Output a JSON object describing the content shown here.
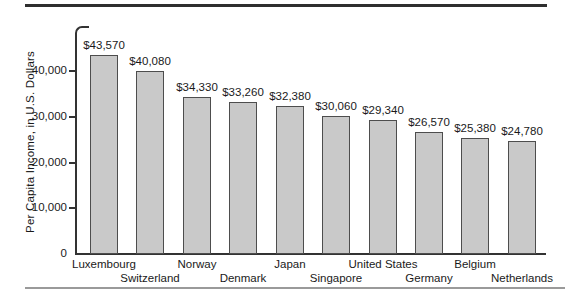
{
  "chart_data": {
    "type": "bar",
    "title": "",
    "categories": [
      "Luxembourg",
      "Switzerland",
      "Norway",
      "Denmark",
      "Japan",
      "Singapore",
      "United States",
      "Germany",
      "Belgium",
      "Netherlands"
    ],
    "values": [
      43570,
      40080,
      34330,
      33260,
      32380,
      30060,
      29340,
      26570,
      25380,
      24780
    ],
    "value_labels": [
      "$43,570",
      "$40,080",
      "$34,330",
      "$33,260",
      "$32,380",
      "$30,060",
      "$29,340",
      "$26,570",
      "$25,380",
      "$24,780"
    ],
    "xlabel": "",
    "ylabel": "Per Capita Income, in U.S. Dollars",
    "ylim": [
      0,
      46000
    ],
    "yticks": [
      0,
      10000,
      20000,
      30000,
      40000
    ],
    "ytick_labels": [
      "0",
      "10,000",
      "20,000",
      "30,000",
      "40,000"
    ],
    "grid": false,
    "legend": false,
    "layout_hints": {
      "bar_orientation": "vertical",
      "category_labels_staggered_two_rows": true
    },
    "colors": {
      "bar_fill": "#c9c9c9",
      "bar_border": "#4d4d4d",
      "axis": "#333333",
      "text": "#1a1a1a",
      "top_rule": "#2f2f2f",
      "bottom_rule": "#9a9a9a"
    }
  }
}
